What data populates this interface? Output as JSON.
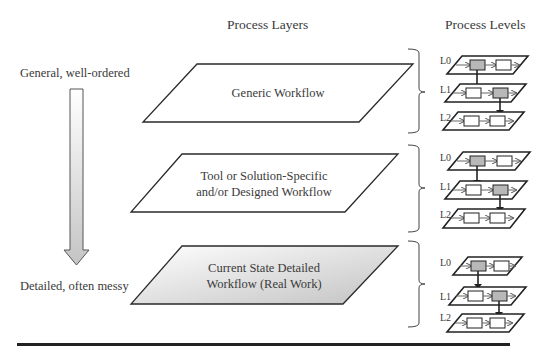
{
  "headers": {
    "layers": "Process Layers",
    "levels": "Process Levels"
  },
  "side_labels": {
    "top": "General, well-ordered",
    "bottom": "Detailed, often messy"
  },
  "layers": [
    {
      "lines": [
        "Generic Workflow"
      ],
      "fill": "white"
    },
    {
      "lines": [
        "Tool or Solution-Specific",
        "and/or Designed Workflow"
      ],
      "fill": "white"
    },
    {
      "lines": [
        "Current State Detailed",
        "Workflow (Real Work)"
      ],
      "fill": "gradient-gray"
    }
  ],
  "level_labels": [
    "L0",
    "L1",
    "L2"
  ],
  "colors": {
    "stroke": "#2a2a2a",
    "text": "#3a3a3a",
    "highlight_box": "#b8b8b8",
    "gradient_start": "#ffffff",
    "gradient_end": "#c8c8c8"
  }
}
